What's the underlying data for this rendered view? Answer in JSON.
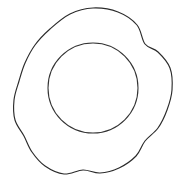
{
  "image": {
    "kind": "line-drawing",
    "subject": "plate",
    "title": "Scalloped plate outline",
    "width": 188,
    "height": 183,
    "background_color": "#ffffff",
    "stroke_color": "#2b2b2b",
    "stroke_width": 1.15,
    "fill": "none",
    "caption": ""
  },
  "shapes": {
    "outer_rim": {
      "name": "scalloped outer rim",
      "type": "closed-wavy-contour",
      "lobe_count": 8,
      "center": {
        "x": 93,
        "y": 90
      },
      "radius_max": 82,
      "radius_min": 71,
      "bounds": {
        "left": 13,
        "top": 6,
        "right": 175,
        "bottom": 176
      },
      "stroke_color": "#2b2b2b",
      "points": [
        {
          "x": 93,
          "y": 8
        },
        {
          "x": 118,
          "y": 12
        },
        {
          "x": 137,
          "y": 25
        },
        {
          "x": 145,
          "y": 44
        },
        {
          "x": 158,
          "y": 52
        },
        {
          "x": 170,
          "y": 68
        },
        {
          "x": 172,
          "y": 90
        },
        {
          "x": 167,
          "y": 110
        },
        {
          "x": 158,
          "y": 128
        },
        {
          "x": 145,
          "y": 141
        },
        {
          "x": 136,
          "y": 156
        },
        {
          "x": 119,
          "y": 168
        },
        {
          "x": 100,
          "y": 173
        },
        {
          "x": 83,
          "y": 170
        },
        {
          "x": 64,
          "y": 174
        },
        {
          "x": 45,
          "y": 166
        },
        {
          "x": 32,
          "y": 152
        },
        {
          "x": 24,
          "y": 136
        },
        {
          "x": 15,
          "y": 120
        },
        {
          "x": 14,
          "y": 100
        },
        {
          "x": 19,
          "y": 81
        },
        {
          "x": 25,
          "y": 63
        },
        {
          "x": 35,
          "y": 45
        },
        {
          "x": 50,
          "y": 29
        },
        {
          "x": 70,
          "y": 14
        }
      ]
    },
    "inner_well": {
      "name": "inner circle well",
      "type": "circle",
      "center": {
        "x": 93,
        "y": 88
      },
      "radius": 45,
      "bounds": {
        "left": 48,
        "top": 43,
        "right": 138,
        "bottom": 133
      },
      "stroke_color": "#333333",
      "stroke_width": 1.05
    }
  },
  "labels": {
    "outer_rim": "outer scalloped rim",
    "inner_well": "inner circular well"
  }
}
